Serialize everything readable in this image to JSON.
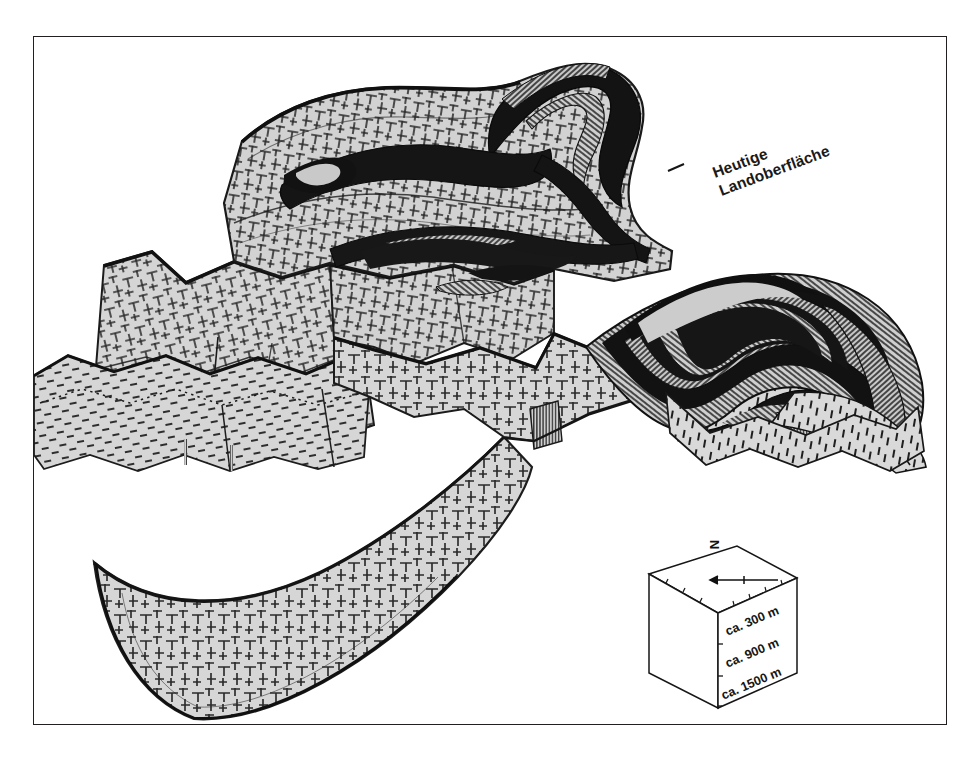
{
  "figure": {
    "kind": "geological-block-diagram",
    "title_text": "",
    "annotations": {
      "surface_label_line1": "Heutige",
      "surface_label_line2": "Landoberfläche",
      "surface_label_full": "Heutige Landoberfläche",
      "leader_line": "leader-dash"
    },
    "scale_cube": {
      "north_letter": "N",
      "north_arrow": "arrow-left",
      "depth_labels": [
        "ca. 300 m",
        "ca. 900 m",
        "ca. 1500 m"
      ],
      "depth_values_m": [
        300,
        900,
        1500
      ],
      "depth_unit": "m",
      "approx_prefix": "ca."
    },
    "colors": {
      "ink": "#231f20",
      "rock_light": "#d4d4d4",
      "rock_mid": "#b9b9b9",
      "rock_dark": "#1b1b1b",
      "paper": "#ffffff",
      "frame": "#231f20"
    },
    "legend_patterns": {
      "gneiss": "cross-and-tee-hatch",
      "schist": "short-dash-hatch",
      "amphibolite": "solid-dark-band",
      "cut_face": "fine-vertical-ruling"
    }
  }
}
